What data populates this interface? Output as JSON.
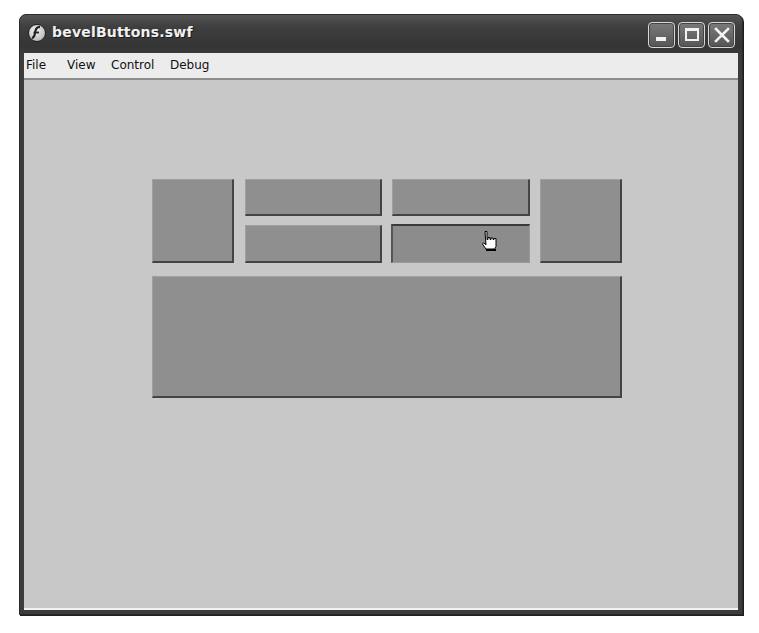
{
  "window": {
    "title": "bevelButtons.swf",
    "app_icon": "flash-player-icon",
    "controls": {
      "minimize": "minimize-icon",
      "maximize": "maximize-icon",
      "close": "close-icon"
    }
  },
  "menubar": {
    "items": [
      {
        "label": "File"
      },
      {
        "label": "View"
      },
      {
        "label": "Control"
      },
      {
        "label": "Debug"
      }
    ]
  },
  "stage": {
    "background_color": "#c8c8c8",
    "button_color": "#8f8f8f",
    "buttons": [
      {
        "name": "left-tall",
        "state": "up"
      },
      {
        "name": "top-middle-left",
        "state": "up"
      },
      {
        "name": "top-middle-right",
        "state": "up"
      },
      {
        "name": "bottom-middle-left",
        "state": "up"
      },
      {
        "name": "bottom-middle-right",
        "state": "pressed"
      },
      {
        "name": "right-tall",
        "state": "up"
      },
      {
        "name": "wide-bottom",
        "state": "up"
      }
    ],
    "cursor": "hand-pointer-icon"
  }
}
